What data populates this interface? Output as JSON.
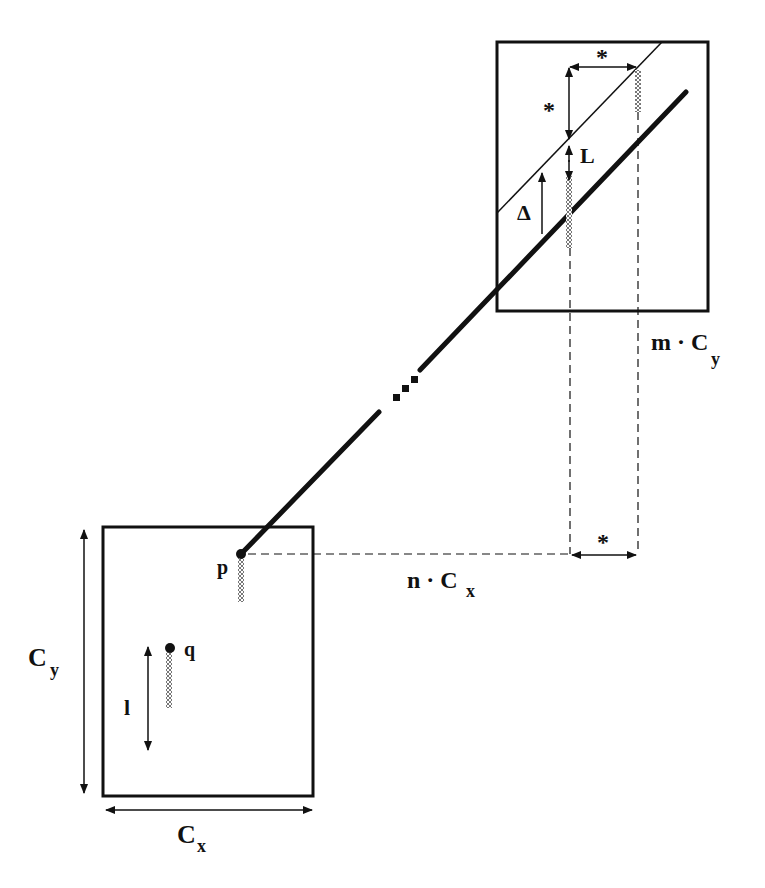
{
  "diagram": {
    "labels": {
      "p": "p",
      "q": "q",
      "l": "l",
      "L": "L",
      "delta": "Δ",
      "star_top": "*",
      "star_left": "*",
      "star_bottom": "*",
      "cx_base": "C",
      "cx_sub": "x",
      "cy_base": "C",
      "cy_sub": "y",
      "n_cx_prefix": "n · C",
      "n_cx_sub": "x",
      "m_cy_prefix": "m · C",
      "m_cy_sub": "y"
    },
    "colors": {
      "ink": "#111111",
      "hatch": "#9a9a9a",
      "background": "#ffffff"
    },
    "boxes": {
      "bottom_cell": {
        "x": 103,
        "y": 527,
        "w": 210,
        "h": 269
      },
      "top_cell": {
        "x": 497,
        "y": 42,
        "w": 211,
        "h": 269
      }
    }
  }
}
